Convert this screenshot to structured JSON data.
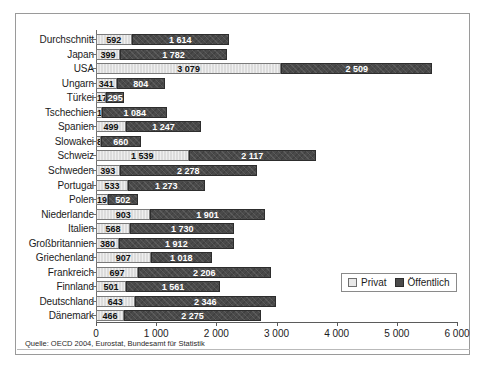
{
  "chart_data": {
    "type": "bar",
    "orientation": "horizontal",
    "stacked": true,
    "title": "",
    "subtitle": "",
    "xlabel": "",
    "ylabel": "",
    "xlim": [
      0,
      6000
    ],
    "xticks": [
      "0",
      "1 000",
      "2 000",
      "3 000",
      "4 000",
      "5 000",
      "6 000"
    ],
    "xtick_values": [
      0,
      1000,
      2000,
      3000,
      4000,
      5000,
      6000
    ],
    "grid": false,
    "legend_position": "inside-right-lower",
    "categories": [
      "Durchschnitt",
      "Japan",
      "USA",
      "Ungarn",
      "Türkei",
      "Tschechien",
      "Spanien",
      "Slowakei",
      "Schweiz",
      "Schweden",
      "Portugal",
      "Polen",
      "Niederlande",
      "Italien",
      "Großbritannien",
      "Griechenland",
      "Frankreich",
      "Finnland",
      "Deutschland",
      "Dänemark"
    ],
    "series": [
      {
        "name": "Privat",
        "color": "#dcdcdc",
        "values": [
          592,
          399,
          3079,
          341,
          174,
          102,
          499,
          81,
          1539,
          393,
          533,
          192,
          903,
          568,
          380,
          907,
          697,
          501,
          643,
          466
        ],
        "labels": [
          "592",
          "399",
          "3 079",
          "341",
          "174",
          "102",
          "499",
          "81",
          "1 539",
          "393",
          "533",
          "192",
          "903",
          "568",
          "380",
          "907",
          "697",
          "501",
          "643",
          "466"
        ]
      },
      {
        "name": "Öffentlich",
        "color": "#4a4a4a",
        "values": [
          1614,
          1782,
          2509,
          804,
          295,
          1084,
          1247,
          660,
          2117,
          2278,
          1273,
          502,
          1901,
          1730,
          1912,
          1018,
          2206,
          1561,
          2346,
          2275
        ],
        "labels": [
          "1 614",
          "1 782",
          "2 509",
          "804",
          "295",
          "1 084",
          "1 247",
          "660",
          "2 117",
          "2 278",
          "1 273",
          "502",
          "1 901",
          "1 730",
          "1 912",
          "1 018",
          "2 206",
          "1 561",
          "2 346",
          "2 275"
        ]
      }
    ],
    "source": "Quelle: OECD 2004, Eurostat, Bundesamt für Statistik"
  },
  "legend": {
    "items": [
      {
        "label": "Privat",
        "swatch": "private"
      },
      {
        "label": "Öffentlich",
        "swatch": "public"
      }
    ]
  },
  "colors": {
    "private": "#dcdcdc",
    "public": "#4a4a4a",
    "frame": "#9a9a9a",
    "text": "#1b1b1b"
  }
}
